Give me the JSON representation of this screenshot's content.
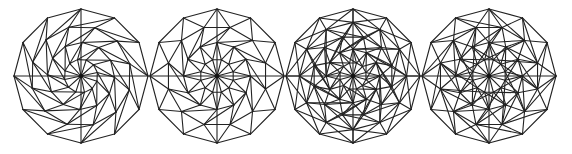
{
  "figure": {
    "background": "#ffffff",
    "stroke_color": "#222222",
    "panels": [
      {
        "id": "mesh-a",
        "label": "twisted dodecagon mesh",
        "cx": 81,
        "cy": 76,
        "r": 67,
        "sides": 12,
        "rings": 4,
        "twist_deg": 14,
        "style": "spiral"
      },
      {
        "id": "mesh-b",
        "label": "radial dodecagon mesh",
        "cx": 217,
        "cy": 76,
        "r": 67,
        "sides": 12,
        "rings": 4,
        "twist_deg": 0,
        "style": "alternating"
      },
      {
        "id": "mesh-c",
        "label": "dense dodecagon mesh",
        "cx": 353,
        "cy": 76,
        "r": 67,
        "sides": 12,
        "rings": 5,
        "twist_deg": 0,
        "style": "dense"
      },
      {
        "id": "mesh-d",
        "label": "star dodecagon mesh",
        "cx": 489,
        "cy": 76,
        "r": 67,
        "sides": 12,
        "rings": 4,
        "twist_deg": 0,
        "style": "star"
      }
    ]
  }
}
